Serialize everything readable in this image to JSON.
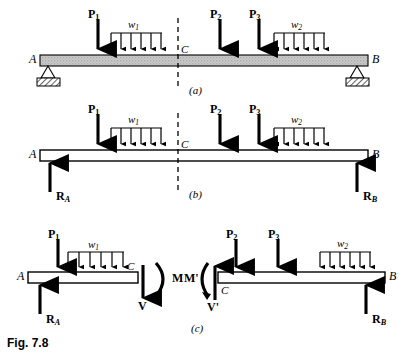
{
  "figure": {
    "caption": "Fig. 7.8",
    "panels": [
      {
        "id": "a",
        "label": "(a)",
        "title": "loaded-beam-with-supports"
      },
      {
        "id": "b",
        "label": "(b)",
        "title": "free-body-diagram-whole-beam"
      },
      {
        "id": "c",
        "label": "(c)",
        "title": "free-body-diagrams-of-cut-segments"
      }
    ]
  },
  "labels": {
    "point_A": "A",
    "point_B": "B",
    "point_C": "C",
    "load_P1": "P",
    "load_P1_sub": "1",
    "load_P2": "P",
    "load_P2_sub": "2",
    "load_P3": "P",
    "load_P3_sub": "3",
    "udl_w1": "w",
    "udl_w1_sub": "1",
    "udl_w2": "w",
    "udl_w2_sub": "2",
    "reaction_A": "R",
    "reaction_A_sub": "A",
    "reaction_B": "R",
    "reaction_B_sub": "B",
    "shear_V": "V",
    "shear_Vprime": "V'",
    "moment_M": "M",
    "moment_Mprime": "M'"
  },
  "colors": {
    "ink": "#000000",
    "beam_fill_textured": "#b9b9b9",
    "beam_fill_hollow": "#ffffff",
    "support_block": "#8a8a8a",
    "background": "#ffffff"
  },
  "geometry": {
    "udl_w1_arrow_count": 6,
    "udl_w2_arrow_count": 6,
    "panel_a": {
      "beam_x0": 40,
      "beam_x1": 368,
      "beam_y": 55,
      "beam_h": 11
    },
    "panel_b": {
      "beam_x0": 40,
      "beam_x1": 368,
      "beam_y": 150,
      "beam_h": 11
    },
    "panel_c_left": {
      "beam_x0": 28,
      "beam_x1": 138,
      "beam_y": 272,
      "beam_h": 11
    },
    "panel_c_right": {
      "beam_x0": 218,
      "beam_x1": 385,
      "beam_y": 272,
      "beam_h": 11
    }
  }
}
